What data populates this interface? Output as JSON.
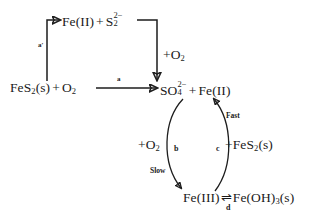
{
  "diagram": {
    "background_color": "#ffffff",
    "stroke_color": "#1d1d1d",
    "nodes": {
      "upper_intermediate": {
        "label": "Fe(II) + S2 2-",
        "parts": {
          "fe2": "Fe(II)",
          "plus": "+",
          "s_symbol": "S",
          "s_sub": "2",
          "s_sup": "2−"
        }
      },
      "reactant": {
        "label": "FeS2(s) + O2",
        "parts": {
          "fe_symbol": "FeS",
          "fe_sub": "2",
          "state": "(s)",
          "plus": "+",
          "o_symbol": "O",
          "o_sub": "2"
        }
      },
      "product": {
        "label": "SO4 2- + Fe(II)",
        "parts": {
          "so_symbol": "SO",
          "so_sub": "4",
          "so_sup": "2−",
          "plus": "+",
          "fe2": "Fe(II)"
        }
      },
      "bottom": {
        "label": "Fe(III) = Fe(OH)3(s)",
        "parts": {
          "fe3": "Fe(III)",
          "equilibrium": "⇌",
          "feoh": "Fe(OH)",
          "feoh_sub": "3",
          "state": "(s)"
        }
      }
    },
    "edge_labels": {
      "a_prime": "a′",
      "a": "a",
      "b": "b",
      "c": "c",
      "d": "d"
    },
    "reagent_labels": {
      "o2_vertical": {
        "symbol": "+O",
        "sub": "2"
      },
      "o2_cycle": {
        "symbol": "+O",
        "sub": "2"
      },
      "fes2_cycle": {
        "symbol": "+FeS",
        "sub": "2",
        "state": "(s)"
      }
    },
    "speed_labels": {
      "fast": "Fast",
      "slow": "Slow"
    }
  }
}
